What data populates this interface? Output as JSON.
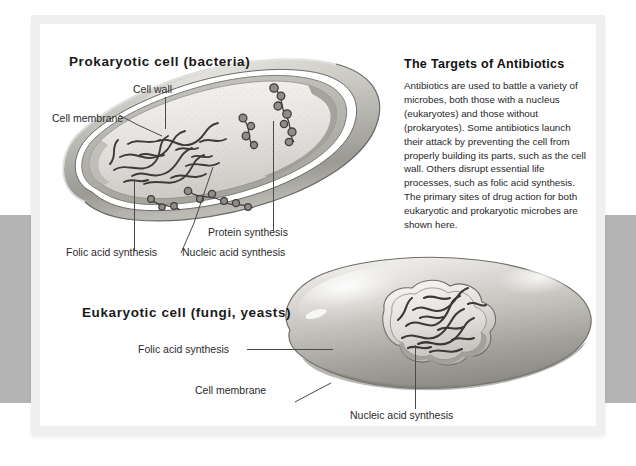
{
  "figure": {
    "prokaryote": {
      "heading": "Prokaryotic cell (bacteria)",
      "labels": {
        "cell_wall": "Cell wall",
        "cell_membrane": "Cell membrane",
        "folic_acid": "Folic acid synthesis",
        "nucleic_acid": "Nucleic acid synthesis",
        "protein": "Protein synthesis"
      }
    },
    "eukaryote": {
      "heading": "Eukaryotic cell (fungi, yeasts)",
      "labels": {
        "folic_acid": "Folic acid synthesis",
        "cell_membrane": "Cell membrane",
        "nucleic_acid": "Nucleic acid synthesis"
      }
    },
    "panel": {
      "title": "The Targets of Antibiotics",
      "body": "Antibiotics are used to battle a variety of microbes, both those with a nucleus (eukaryotes) and those without (prokaryotes). Some antibiotics launch their attack by preventing the cell from properly building its parts, such as the cell wall. Others disrupt essential life processes, such as folic acid synthesis. The primary sites of drug action for both eukaryotic and prokaryotic microbes are shown here."
    },
    "colors": {
      "page_background": "#ffffff",
      "edge_band": "#b4b4b4",
      "card_border": "#efefef",
      "text": "#1a1a1a",
      "leader_line": "#4a4a4a",
      "cell_outline": "#555555",
      "cytoplasm_light": "#f2f1ee",
      "cytoplasm_mid": "#cfcdc8",
      "cell_body_gray": "#b9b7b2",
      "dna_dark": "#3a3a3a"
    }
  }
}
